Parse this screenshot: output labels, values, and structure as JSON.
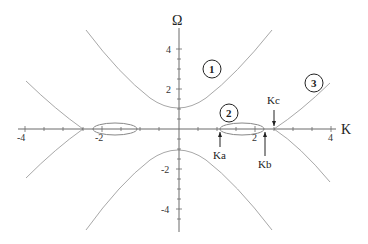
{
  "figure": {
    "axes": {
      "x_label": "K",
      "y_label": "Ω",
      "x_ticks": [
        {
          "value": -4,
          "label": "-4"
        },
        {
          "value": -2,
          "label": "-2"
        },
        {
          "value": 2,
          "label": "2"
        },
        {
          "value": 4,
          "label": "4"
        }
      ],
      "y_ticks": [
        {
          "value": 4,
          "label": "4"
        },
        {
          "value": 2,
          "label": "2"
        },
        {
          "value": -2,
          "label": "-2"
        },
        {
          "value": -4,
          "label": "-4"
        }
      ],
      "x_range": [
        -4.2,
        4.2
      ],
      "y_range": [
        -5,
        5
      ]
    },
    "regions": [
      {
        "id": "1",
        "label": "1"
      },
      {
        "id": "2",
        "label": "2"
      },
      {
        "id": "3",
        "label": "3"
      }
    ],
    "annotations": [
      {
        "label": "Ka",
        "k": 1.1,
        "arrow": "up"
      },
      {
        "label": "Kb",
        "k": 2.27,
        "arrow": "up"
      },
      {
        "label": "Kc",
        "k": 2.5,
        "arrow": "down"
      }
    ]
  },
  "colors": {
    "curve": "#a8a8a8",
    "axis": "#6a6a6a",
    "text": "#222222"
  }
}
